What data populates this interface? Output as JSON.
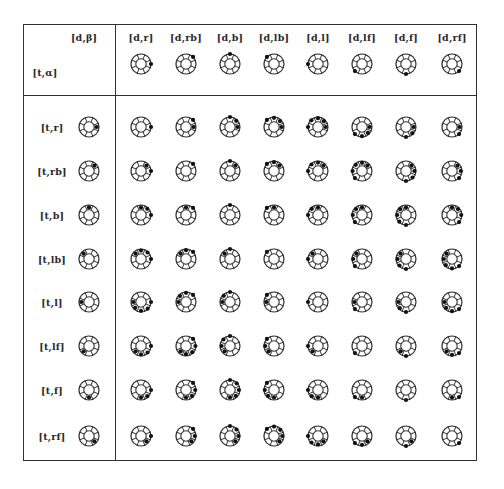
{
  "corner": {
    "d_label": "[d,β]",
    "t_label": "[t,α]"
  },
  "directions": {
    "r": 0,
    "rb": 45,
    "b": 90,
    "lb": 135,
    "l": 180,
    "lf": 225,
    "f": 270,
    "rf": 315
  },
  "columns": [
    {
      "key": "r",
      "label": "[d,r]"
    },
    {
      "key": "rb",
      "label": "[d,rb]"
    },
    {
      "key": "b",
      "label": "[d,b]"
    },
    {
      "key": "lb",
      "label": "[d,lb]"
    },
    {
      "key": "l",
      "label": "[d,l]"
    },
    {
      "key": "lf",
      "label": "[d,lf]"
    },
    {
      "key": "f",
      "label": "[d,f]"
    },
    {
      "key": "rf",
      "label": "[d,rf]"
    }
  ],
  "rows": [
    {
      "key": "r",
      "label": "[t,r]"
    },
    {
      "key": "rb",
      "label": "[t,rb]"
    },
    {
      "key": "b",
      "label": "[t,b]"
    },
    {
      "key": "lb",
      "label": "[t,lb]"
    },
    {
      "key": "l",
      "label": "[t,l]"
    },
    {
      "key": "lf",
      "label": "[t,lf]"
    },
    {
      "key": "f",
      "label": "[t,f]"
    },
    {
      "key": "rf",
      "label": "[t,rf]"
    }
  ],
  "icon": {
    "outer_radius": 10,
    "inner_radius": 5.2,
    "spokes": 8,
    "dot_radius": 2.1,
    "stroke_color": "#333333",
    "dot_color": "#111111"
  },
  "layout": {
    "col_x": [
      141,
      186,
      230,
      274,
      318,
      362,
      406,
      452
    ],
    "header_label_y": 37,
    "header_icon_y": 64,
    "row_y": [
      127,
      171,
      215,
      259,
      302,
      346,
      390,
      436
    ],
    "row_label_x": 52,
    "row_icon_x": 89,
    "corner_d_x": 84,
    "corner_d_y": 37,
    "corner_t_x": 45,
    "corner_t_y": 72
  }
}
